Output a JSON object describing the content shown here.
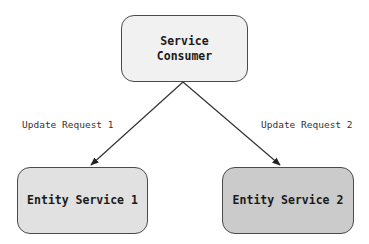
{
  "diagram": {
    "nodes": [
      {
        "id": "consumer",
        "label": "Service\nConsumer",
        "fill": "#f1f1f1"
      },
      {
        "id": "entity1",
        "label": "Entity Service 1",
        "fill": "#e1e1e1"
      },
      {
        "id": "entity2",
        "label": "Entity Service 2",
        "fill": "#cbcbcb"
      }
    ],
    "edges": [
      {
        "from": "consumer",
        "to": "entity1",
        "label": "Update Request 1"
      },
      {
        "from": "consumer",
        "to": "entity2",
        "label": "Update Request 2"
      }
    ],
    "colors": {
      "stroke": "#4a4a4a",
      "arrow": "#333333"
    }
  }
}
